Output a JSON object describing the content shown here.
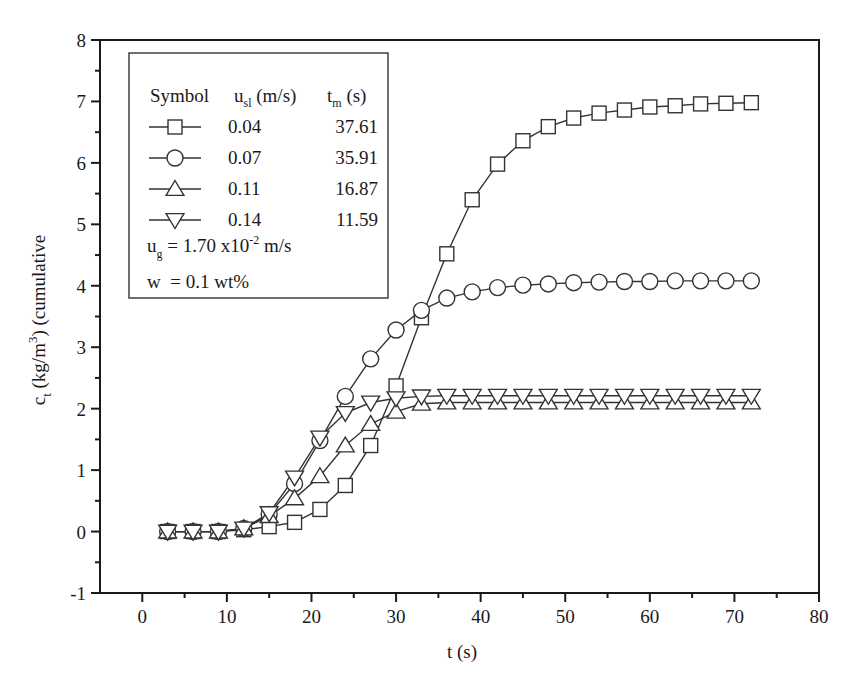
{
  "chart_data": {
    "type": "line",
    "title": "",
    "xlabel": "t (s)",
    "ylabel": "c_t (kg/m^3) (cumulative",
    "ylabel_parts": {
      "main": "c",
      "sub": "t",
      "unit_pre": " (kg/m",
      "sup": "3",
      "unit_post": ") (cumulative"
    },
    "xlim": [
      -5,
      80
    ],
    "ylim": [
      -1,
      8
    ],
    "xticks": [
      0,
      10,
      20,
      30,
      40,
      50,
      60,
      70,
      80
    ],
    "yticks": [
      -1,
      0,
      1,
      2,
      3,
      4,
      5,
      6,
      7,
      8
    ],
    "grid": false,
    "legend_position": "upper-left",
    "x": [
      3,
      6,
      9,
      12,
      15,
      18,
      21,
      24,
      27,
      30,
      33,
      36,
      39,
      42,
      45,
      48,
      51,
      54,
      57,
      60,
      63,
      66,
      69,
      72
    ],
    "series": [
      {
        "name": "u_sl = 0.04 m/s, t_m = 37.61 s",
        "marker": "square",
        "values": [
          0,
          0,
          0,
          0.03,
          0.08,
          0.15,
          0.36,
          0.75,
          1.4,
          2.37,
          3.48,
          4.52,
          5.4,
          5.98,
          6.36,
          6.59,
          6.73,
          6.81,
          6.86,
          6.91,
          6.93,
          6.96,
          6.97,
          6.98
        ]
      },
      {
        "name": "u_sl = 0.07 m/s, t_m = 35.91 s",
        "marker": "circle",
        "values": [
          0,
          0,
          0,
          0.05,
          0.28,
          0.78,
          1.48,
          2.2,
          2.81,
          3.28,
          3.6,
          3.8,
          3.9,
          3.97,
          4.01,
          4.03,
          4.05,
          4.06,
          4.07,
          4.07,
          4.08,
          4.08,
          4.08,
          4.08
        ]
      },
      {
        "name": "u_sl = 0.11 m/s, t_m = 16.87 s",
        "marker": "triangle-up",
        "values": [
          0,
          0,
          0,
          0.05,
          0.25,
          0.54,
          0.9,
          1.4,
          1.75,
          1.95,
          2.08,
          2.1,
          2.1,
          2.1,
          2.1,
          2.1,
          2.1,
          2.1,
          2.1,
          2.1,
          2.1,
          2.1,
          2.1,
          2.1
        ]
      },
      {
        "name": "u_sl = 0.14 m/s, t_m = 11.59 s",
        "marker": "triangle-down",
        "values": [
          0,
          0,
          0,
          0.05,
          0.3,
          0.88,
          1.53,
          1.93,
          2.1,
          2.17,
          2.2,
          2.21,
          2.21,
          2.21,
          2.21,
          2.21,
          2.21,
          2.21,
          2.21,
          2.21,
          2.21,
          2.21,
          2.21,
          2.21
        ]
      }
    ]
  },
  "legend": {
    "header": {
      "symbol": "Symbol",
      "usl": "u",
      "usl_sub": "sl",
      "usl_unit": " (m/s)",
      "tm": "t",
      "tm_sub": "m",
      "tm_unit": " (s)"
    },
    "rows": [
      {
        "marker": "square",
        "usl": "0.04",
        "tm": "37.61"
      },
      {
        "marker": "circle",
        "usl": "0.07",
        "tm": "35.91"
      },
      {
        "marker": "triangle-up",
        "usl": "0.11",
        "tm": "16.87"
      },
      {
        "marker": "triangle-down",
        "usl": "0.14",
        "tm": "11.59"
      }
    ],
    "ug": {
      "label": "u",
      "sub": "g",
      "eq": " = 1.70 x10",
      "sup": "-2",
      "unit": " m/s"
    },
    "w": {
      "label": "w",
      "eq": "  = 0.1 wt%"
    }
  },
  "colors": {
    "line": "#333333",
    "axis": "#1a1a1a",
    "background": "#ffffff",
    "marker_fill": "#ffffff"
  }
}
